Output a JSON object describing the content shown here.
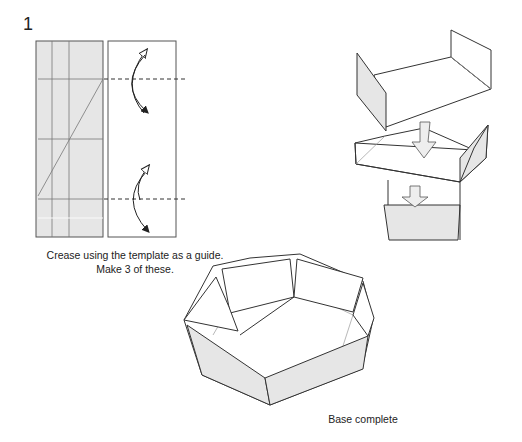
{
  "step": {
    "number": "1"
  },
  "captions": {
    "crease_line1": "Crease using the template as a guide.",
    "crease_line2": "Make 3 of these.",
    "base": "Base complete"
  },
  "colors": {
    "paper_gray": "#e6e6e6",
    "line": "#333333",
    "thin_line": "#777777"
  }
}
